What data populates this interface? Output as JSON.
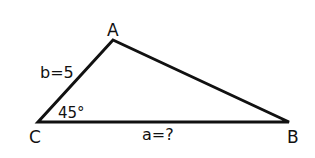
{
  "diagram": {
    "type": "triangle",
    "vertices": {
      "A": {
        "label": "A",
        "x": 113,
        "y": 40
      },
      "B": {
        "label": "B",
        "x": 289,
        "y": 122
      },
      "C": {
        "label": "C",
        "x": 38,
        "y": 122
      }
    },
    "sides": {
      "b": {
        "label": "b=5"
      },
      "a": {
        "label": "a=?"
      }
    },
    "angle_C": {
      "label": "45°"
    },
    "stroke_color": "#111111",
    "background": "#ffffff"
  }
}
